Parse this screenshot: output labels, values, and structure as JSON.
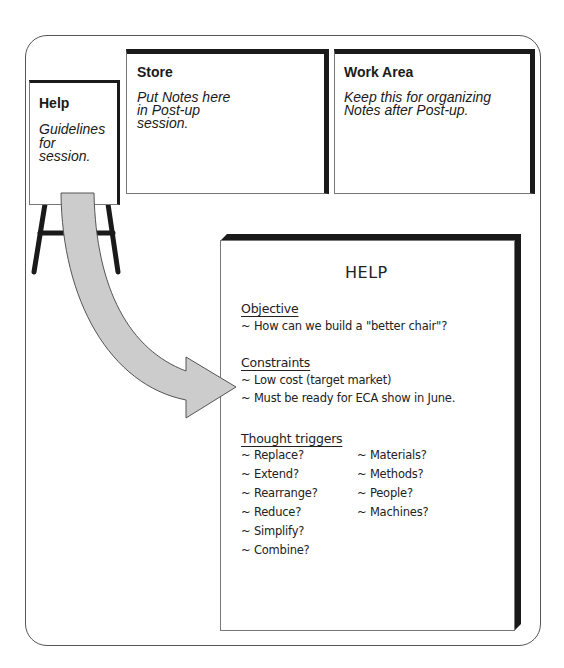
{
  "cards": {
    "help": {
      "title": "Help",
      "desc_lines": [
        "Guidelines",
        "for",
        "session."
      ]
    },
    "store": {
      "title": "Store",
      "desc_lines": [
        "Put Notes here",
        "in Post-up",
        "session."
      ]
    },
    "work_area": {
      "title": "Work Area",
      "desc_lines": [
        "Keep this for organizing",
        "Notes after Post-up."
      ]
    }
  },
  "help_sheet": {
    "title": "HELP",
    "objective": {
      "heading": "Objective",
      "items": [
        "~ How can we build a \"better chair\"?"
      ]
    },
    "constraints": {
      "heading": "Constraints",
      "items": [
        "~ Low cost (target market)",
        "~ Must be ready for ECA show in June."
      ]
    },
    "thought_triggers": {
      "heading": "Thought triggers",
      "left_items": [
        "~ Replace?",
        "~ Extend?",
        "~ Rearrange?",
        "~ Reduce?",
        "~ Simplify?",
        "~ Combine?"
      ],
      "right_items": [
        "~ Materials?",
        "~ Methods?",
        "~ People?",
        "~ Machines?"
      ]
    }
  },
  "colors": {
    "arrow_fill": "#cccccc",
    "arrow_stroke": "#555555",
    "border_dark": "#1a1a1a",
    "frame": "#555555"
  }
}
